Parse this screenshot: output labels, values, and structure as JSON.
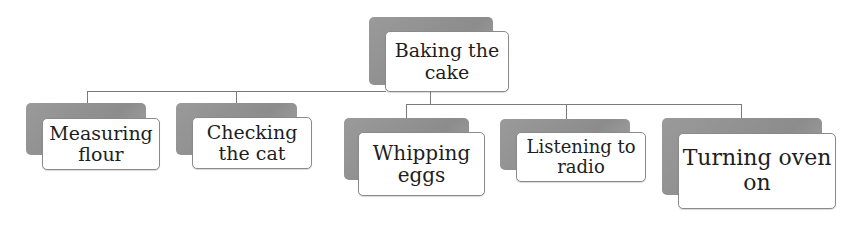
{
  "diagram": {
    "root": {
      "label": "Baking the cake",
      "line1": "Baking the",
      "line2": "cake"
    },
    "children": [
      {
        "label": "Measuring flour",
        "line1": "Measuring",
        "line2": "flour"
      },
      {
        "label": "Checking the cat",
        "line1": "Checking",
        "line2": "the cat"
      },
      {
        "label": "Whipping eggs",
        "line1": "Whipping",
        "line2": "eggs"
      },
      {
        "label": "Listening to radio",
        "line1": "Listening to",
        "line2": "radio"
      },
      {
        "label": "Turning oven on",
        "line1": "Turning oven",
        "line2": "on"
      }
    ]
  },
  "colors": {
    "box_fill": "#ffffff",
    "box_shadow_fill": "#949494",
    "connector": "#7a7a7a",
    "text": "#1e1e1e"
  }
}
